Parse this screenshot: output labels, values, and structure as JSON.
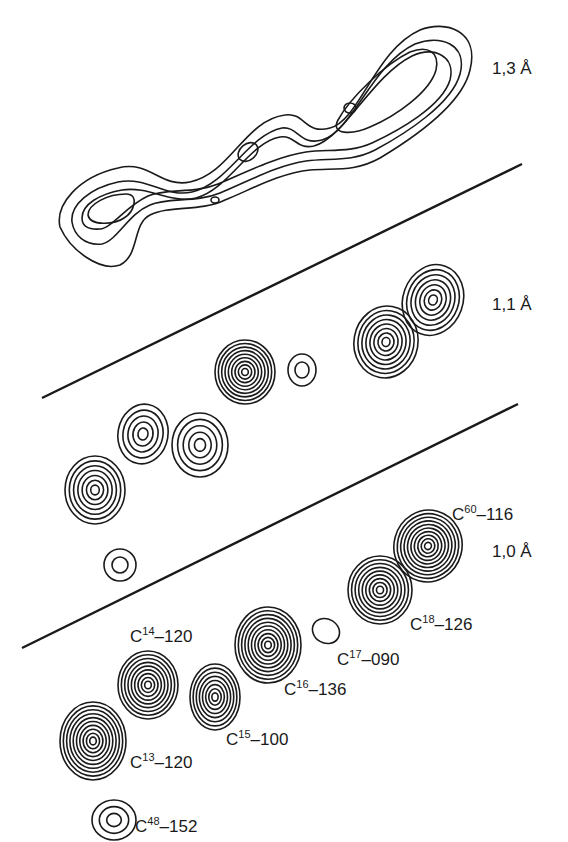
{
  "figure": {
    "panels": [
      {
        "id": "panel-1-3",
        "resolution_label": "1,3 Å"
      },
      {
        "id": "panel-1-1",
        "resolution_label": "1,1 Å"
      },
      {
        "id": "panel-1-0",
        "resolution_label": "1,0 Å"
      }
    ],
    "atom_labels": [
      {
        "atom": "C",
        "number": "60",
        "value": "116"
      },
      {
        "atom": "C",
        "number": "18",
        "value": "126"
      },
      {
        "atom": "C",
        "number": "17",
        "value": "090"
      },
      {
        "atom": "C",
        "number": "16",
        "value": "136"
      },
      {
        "atom": "C",
        "number": "14",
        "value": "120"
      },
      {
        "atom": "C",
        "number": "15",
        "value": "100"
      },
      {
        "atom": "C",
        "number": "13",
        "value": "120"
      },
      {
        "atom": "C",
        "number": "48",
        "value": "152"
      }
    ],
    "dash": "–"
  }
}
